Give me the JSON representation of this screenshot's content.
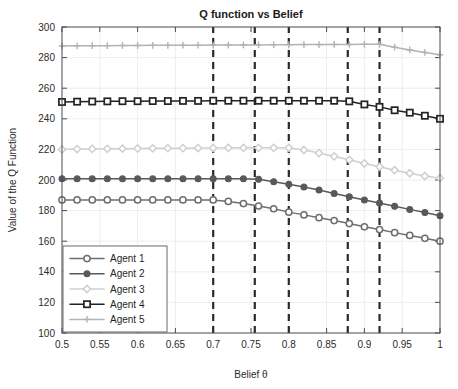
{
  "chart_data": {
    "type": "line",
    "title": "Q function vs Belief",
    "xlabel": "Belief θ",
    "ylabel": "Value of the Q Function",
    "xlim": [
      0.5,
      1.0
    ],
    "ylim": [
      100,
      300
    ],
    "grid": true,
    "legend_position": "lower-left",
    "xticks": [
      0.5,
      0.55,
      0.6,
      0.65,
      0.7,
      0.75,
      0.8,
      0.85,
      0.9,
      0.95,
      1
    ],
    "xtick_labels": [
      "0.5",
      "0.55",
      "0.6",
      "0.65",
      "0.7",
      "0.75",
      "0.8",
      "0.85",
      "0.9",
      "0.95",
      "1"
    ],
    "yticks": [
      100,
      120,
      140,
      160,
      180,
      200,
      220,
      240,
      260,
      280,
      300
    ],
    "ytick_labels": [
      "100",
      "120",
      "140",
      "160",
      "180",
      "200",
      "220",
      "240",
      "260",
      "280",
      "300"
    ],
    "x": [
      0.5,
      0.52,
      0.54,
      0.56,
      0.58,
      0.6,
      0.62,
      0.64,
      0.66,
      0.68,
      0.7,
      0.72,
      0.74,
      0.76,
      0.78,
      0.8,
      0.82,
      0.84,
      0.86,
      0.88,
      0.9,
      0.92,
      0.94,
      0.96,
      0.98,
      1.0
    ],
    "series": [
      {
        "name": "Agent 1",
        "color": "#6e6e6e",
        "marker": "circle-open",
        "values": [
          187.0,
          187.0,
          187.0,
          187.0,
          187.0,
          187.0,
          187.0,
          187.0,
          187.0,
          187.0,
          187.0,
          186.0,
          184.6,
          183.0,
          181.2,
          179.0,
          177.2,
          175.4,
          173.5,
          171.5,
          169.4,
          167.6,
          165.6,
          163.8,
          161.9,
          160.0
        ]
      },
      {
        "name": "Agent 2",
        "color": "#595959",
        "marker": "circle-filled",
        "values": [
          200.8,
          200.8,
          200.8,
          200.8,
          200.8,
          200.8,
          200.8,
          200.8,
          200.8,
          200.8,
          200.8,
          200.8,
          200.8,
          200.5,
          198.9,
          197.2,
          195.4,
          193.4,
          191.2,
          189.0,
          187.0,
          185.0,
          182.8,
          180.8,
          178.8,
          176.6
        ]
      },
      {
        "name": "Agent 3",
        "color": "#cfcfcf",
        "marker": "diamond-open",
        "values": [
          220.0,
          220.2,
          220.3,
          220.4,
          220.5,
          220.6,
          220.7,
          220.8,
          220.8,
          220.9,
          220.9,
          221.0,
          221.0,
          221.0,
          221.0,
          221.0,
          219.6,
          217.6,
          215.4,
          213.2,
          210.8,
          208.6,
          206.4,
          204.4,
          202.6,
          201.2
        ]
      },
      {
        "name": "Agent 4",
        "color": "#232323",
        "marker": "square-open",
        "values": [
          251.0,
          251.2,
          251.3,
          251.4,
          251.5,
          251.5,
          251.6,
          251.6,
          251.7,
          251.7,
          251.8,
          251.8,
          251.8,
          251.8,
          251.8,
          251.8,
          251.8,
          251.8,
          251.8,
          251.4,
          249.4,
          247.8,
          245.6,
          244.0,
          242.0,
          240.0
        ]
      },
      {
        "name": "Agent 5",
        "color": "#b3b3b3",
        "marker": "plus",
        "values": [
          287.6,
          287.7,
          287.8,
          287.8,
          287.9,
          287.9,
          288.0,
          288.0,
          288.1,
          288.1,
          288.2,
          288.2,
          288.3,
          288.3,
          288.4,
          288.4,
          288.5,
          288.5,
          288.6,
          288.6,
          288.7,
          288.7,
          286.8,
          285.0,
          283.4,
          281.8
        ]
      }
    ],
    "annotations": {
      "type": "vertical-dashed-threshold-lines",
      "color": "#2a2a2a",
      "x_positions": [
        0.7,
        0.755,
        0.8,
        0.878,
        0.92
      ]
    }
  },
  "legend": {
    "entries": [
      {
        "label": "Agent 1"
      },
      {
        "label": "Agent 2"
      },
      {
        "label": "Agent 3"
      },
      {
        "label": "Agent 4"
      },
      {
        "label": "Agent 5"
      }
    ]
  }
}
